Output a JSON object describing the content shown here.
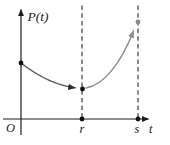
{
  "figure": {
    "labels": {
      "y_axis": "P(t)",
      "origin": "O",
      "r": "r",
      "s": "s",
      "x_axis": "t"
    },
    "colors": {
      "axis": "#1d1d1d",
      "dashed": "#3c3c3c",
      "curve_left": "#5a5a5a",
      "curve_right": "#8f8f8f",
      "point": "#101010",
      "point_end": "#8a8a8a"
    }
  }
}
